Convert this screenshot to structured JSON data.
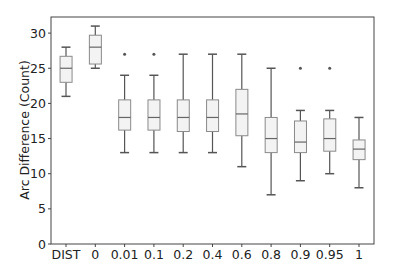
{
  "chart_data": {
    "type": "box",
    "title": "",
    "xlabel": "",
    "ylabel": "Arc Difference (Count)",
    "ylim": [
      0,
      32
    ],
    "yticks": [
      0,
      5,
      10,
      15,
      20,
      25,
      30
    ],
    "grid": false,
    "legend": null,
    "categories": [
      "DIST",
      "0",
      "0.01",
      "0.1",
      "0.2",
      "0.4",
      "0.6",
      "0.8",
      "0.9",
      "0.95",
      "1"
    ],
    "boxes": [
      {
        "label": "DIST",
        "whislo": 21,
        "q1": 23,
        "med": 25,
        "q3": 26.7,
        "whishi": 28,
        "fliers": []
      },
      {
        "label": "0",
        "whislo": 25,
        "q1": 25.6,
        "med": 28,
        "q3": 29.7,
        "whishi": 31,
        "fliers": []
      },
      {
        "label": "0.01",
        "whislo": 13,
        "q1": 16.2,
        "med": 18,
        "q3": 20.5,
        "whishi": 24,
        "fliers": [
          27
        ]
      },
      {
        "label": "0.1",
        "whislo": 13,
        "q1": 16.2,
        "med": 18,
        "q3": 20.5,
        "whishi": 24,
        "fliers": [
          27
        ]
      },
      {
        "label": "0.2",
        "whislo": 13,
        "q1": 16,
        "med": 18,
        "q3": 20.5,
        "whishi": 27,
        "fliers": []
      },
      {
        "label": "0.4",
        "whislo": 13,
        "q1": 16,
        "med": 18,
        "q3": 20.5,
        "whishi": 27,
        "fliers": []
      },
      {
        "label": "0.6",
        "whislo": 11,
        "q1": 15.4,
        "med": 18.5,
        "q3": 22,
        "whishi": 27,
        "fliers": []
      },
      {
        "label": "0.8",
        "whislo": 7,
        "q1": 13,
        "med": 15,
        "q3": 18,
        "whishi": 25,
        "fliers": []
      },
      {
        "label": "0.9",
        "whislo": 9,
        "q1": 13,
        "med": 14.5,
        "q3": 17.5,
        "whishi": 19,
        "fliers": [
          25
        ]
      },
      {
        "label": "0.95",
        "whislo": 10,
        "q1": 13.2,
        "med": 15,
        "q3": 17.8,
        "whishi": 19,
        "fliers": [
          25
        ]
      },
      {
        "label": "1",
        "whislo": 8,
        "q1": 12,
        "med": 13.5,
        "q3": 14.8,
        "whishi": 18,
        "fliers": []
      }
    ],
    "colors": {
      "box_fill": "#f3f3f3",
      "box_edge": "#8a8a8a",
      "whisker": "#555555",
      "median": "#666666",
      "flier": "#555555",
      "frame": "#444444"
    }
  }
}
